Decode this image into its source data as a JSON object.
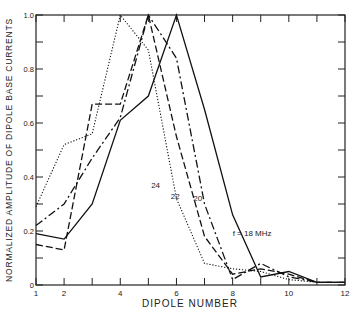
{
  "chart_data": {
    "type": "line",
    "title": "",
    "xlabel": "DIPOLE NUMBER",
    "ylabel": "NORMALIZED AMPLITUDE OF DIPOLE BASE CURRENTS",
    "x": [
      1,
      2,
      3,
      4,
      5,
      6,
      7,
      8,
      9,
      10,
      11,
      12
    ],
    "xlim": [
      1,
      12
    ],
    "ylim": [
      0,
      1.0
    ],
    "x_tick_labels": [
      "1",
      "2",
      "4",
      "6",
      "8",
      "10",
      "12"
    ],
    "x_tick_label_positions": [
      1,
      2,
      4,
      6,
      8,
      10,
      12
    ],
    "y_tick_labels": [
      "0",
      "0.2",
      "0.4",
      "0.6",
      "0.8",
      "1.0"
    ],
    "y_tick_label_positions": [
      0,
      0.2,
      0.4,
      0.6,
      0.8,
      1.0
    ],
    "grid": false,
    "series": [
      {
        "name": "18",
        "style": "solid",
        "label": "f = 18 MHz",
        "values": [
          0.19,
          0.17,
          0.3,
          0.61,
          0.7,
          1.0,
          0.65,
          0.26,
          0.03,
          0.05,
          0.01,
          0.01
        ]
      },
      {
        "name": "20",
        "style": "dashdot",
        "label": "20",
        "values": [
          0.22,
          0.3,
          0.47,
          0.62,
          1.0,
          0.84,
          0.3,
          0.02,
          0.08,
          0.03,
          0.01,
          0.01
        ]
      },
      {
        "name": "22",
        "style": "dashed",
        "label": "22",
        "values": [
          0.15,
          0.13,
          0.67,
          0.67,
          1.0,
          0.55,
          0.18,
          0.04,
          0.06,
          0.04,
          0.01,
          0.01
        ]
      },
      {
        "name": "24",
        "style": "dotted",
        "label": "24",
        "values": [
          0.29,
          0.52,
          0.56,
          1.0,
          0.87,
          0.32,
          0.08,
          0.06,
          0.05,
          0.02,
          0.01,
          0.01
        ]
      }
    ],
    "annotations": [
      {
        "text": "24",
        "x": 5.1,
        "y": 0.36
      },
      {
        "text": "22",
        "x": 5.8,
        "y": 0.32
      },
      {
        "text": "20",
        "x": 6.6,
        "y": 0.31
      },
      {
        "text": "f = 18 MHz",
        "x": 8.0,
        "y": 0.18
      }
    ]
  }
}
